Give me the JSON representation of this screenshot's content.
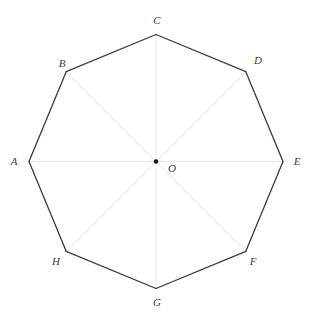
{
  "figure": {
    "name": "Regular octagon ABCDEFGH with center O",
    "background_color": "#ffffff",
    "outline_color": "#3a3a3a",
    "outline_width": 1.3,
    "diagonal_color": "#e6e6e6",
    "diagonal_width": 1,
    "label_color": "#3b3b3b",
    "center_dot_color": "#1a1a1a",
    "center_dot_radius": 2.2,
    "canvas": {
      "width": 311,
      "height": 324
    },
    "center": {
      "x": 156,
      "y": 161.5,
      "label": "O"
    },
    "circumradius": 127,
    "vertices": [
      {
        "id": "A",
        "label": "A",
        "angle_deg": 180,
        "x": 29,
        "y": 161.5,
        "label_x": 14,
        "label_y": 161
      },
      {
        "id": "B",
        "label": "B",
        "angle_deg": 135,
        "x": 66.2,
        "y": 71.7,
        "label_x": 62,
        "label_y": 63
      },
      {
        "id": "C",
        "label": "C",
        "angle_deg": 90,
        "x": 156,
        "y": 34.5,
        "label_x": 157,
        "label_y": 20
      },
      {
        "id": "D",
        "label": "D",
        "angle_deg": 45,
        "x": 245.8,
        "y": 71.7,
        "label_x": 258,
        "label_y": 60
      },
      {
        "id": "E",
        "label": "E",
        "angle_deg": 0,
        "x": 283,
        "y": 161.5,
        "label_x": 297,
        "label_y": 161
      },
      {
        "id": "F",
        "label": "F",
        "angle_deg": -45,
        "x": 245.8,
        "y": 251.3,
        "label_x": 253,
        "label_y": 261
      },
      {
        "id": "G",
        "label": "G",
        "angle_deg": -90,
        "x": 156,
        "y": 288.5,
        "label_x": 157,
        "label_y": 302
      },
      {
        "id": "H",
        "label": "H",
        "angle_deg": -135,
        "x": 66.2,
        "y": 251.3,
        "label_x": 56,
        "label_y": 261
      }
    ],
    "edges": [
      {
        "from": "A",
        "to": "B"
      },
      {
        "from": "B",
        "to": "C"
      },
      {
        "from": "C",
        "to": "D"
      },
      {
        "from": "D",
        "to": "E"
      },
      {
        "from": "E",
        "to": "F"
      },
      {
        "from": "F",
        "to": "G"
      },
      {
        "from": "G",
        "to": "H"
      },
      {
        "from": "H",
        "to": "A"
      }
    ],
    "diagonals": [
      {
        "from": "A",
        "to": "E"
      },
      {
        "from": "B",
        "to": "F"
      },
      {
        "from": "C",
        "to": "G"
      },
      {
        "from": "D",
        "to": "H"
      }
    ]
  }
}
